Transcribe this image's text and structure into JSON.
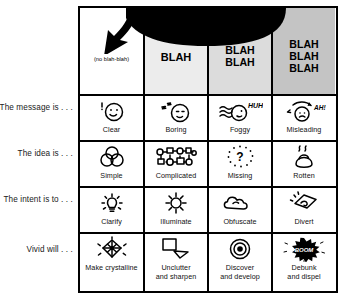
{
  "row_labels": [
    "The message is . . .",
    "The idea is . . .",
    "The intent is to . . .",
    "Vivid will . . ."
  ],
  "columns": [
    {
      "header": "(no blah-blah)",
      "header_style": "small",
      "shade": "#ffffff"
    },
    {
      "header": "BLAH",
      "header_style": "bold",
      "shade": "#ececec"
    },
    {
      "header": "BLAH\nBLAH",
      "header_style": "bold",
      "shade": "#dcdcdc"
    },
    {
      "header": "BLAH\nBLAH\nBLAH",
      "header_style": "bold",
      "shade": "#c4c4c4"
    }
  ],
  "rows": [
    {
      "label": "The message is . . .",
      "cells": [
        {
          "caption": "Clear",
          "icon": "smiling-face-icon"
        },
        {
          "caption": "Boring",
          "icon": "sleeping-face-icon"
        },
        {
          "caption": "Foggy",
          "icon": "foggy-face-icon"
        },
        {
          "caption": "Misleading",
          "icon": "misleading-face-icon"
        }
      ]
    },
    {
      "label": "The idea is . . .",
      "cells": [
        {
          "caption": "Simple",
          "icon": "venn-circles-icon"
        },
        {
          "caption": "Complicated",
          "icon": "network-tangle-icon"
        },
        {
          "caption": "Missing",
          "icon": "dotted-question-mark-icon"
        },
        {
          "caption": "Rotten",
          "icon": "steaming-pile-icon"
        }
      ]
    },
    {
      "label": "The intent is to . . .",
      "cells": [
        {
          "caption": "Clarify",
          "icon": "lightbulb-icon"
        },
        {
          "caption": "Illuminate",
          "icon": "sun-icon"
        },
        {
          "caption": "Obfuscate",
          "icon": "cloud-icon"
        },
        {
          "caption": "Divert",
          "icon": "arrow-sign-icon"
        }
      ]
    },
    {
      "label": "Vivid will . . .",
      "cells": [
        {
          "caption": "Make crystalline",
          "icon": "crystal-icon"
        },
        {
          "caption": "Unclutter\nand sharpen",
          "icon": "shapes-icon"
        },
        {
          "caption": "Discover\nand develop",
          "icon": "bullseye-icon"
        },
        {
          "caption": "Debunk\nand dispel",
          "icon": "boom-burst-icon"
        }
      ]
    }
  ],
  "arrow": {
    "name": "black-curved-arrow",
    "color": "#000000"
  }
}
